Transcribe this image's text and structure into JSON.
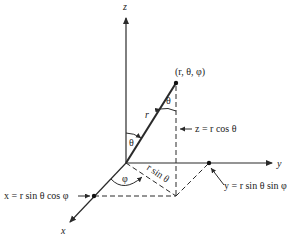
{
  "diagram": {
    "axes": {
      "z": "z",
      "y": "y",
      "x": "x"
    },
    "point_label": "(r, θ, φ)",
    "radius_label": "r",
    "theta_label_bottom": "θ",
    "theta_label_top": "θ",
    "phi_label": "φ",
    "rsin_label": "r sin θ",
    "z_formula": "z = r cos θ",
    "x_formula": "x = r sin θ cos φ",
    "y_formula": "y = r sin θ sin φ",
    "colors": {
      "line": "#2a2a2a",
      "text": "#222222",
      "background": "#ffffff"
    }
  }
}
